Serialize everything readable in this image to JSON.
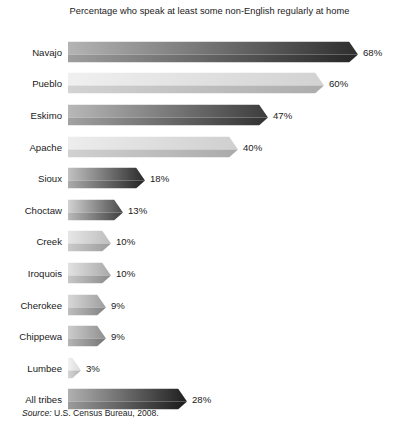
{
  "chart_data": {
    "type": "bar",
    "orientation": "horizontal",
    "title": "Percentage who speak at least some non-English regularly at home",
    "xlabel": "",
    "ylabel": "",
    "xlim": [
      0,
      68
    ],
    "grid": false,
    "legend": null,
    "value_suffix": "%",
    "categories": [
      "Navajo",
      "Pueblo",
      "Eskimo",
      "Apache",
      "Sioux",
      "Choctaw",
      "Creek",
      "Iroquois",
      "Cherokee",
      "Chippewa",
      "Lumbee",
      "All tribes"
    ],
    "values": [
      68,
      60,
      47,
      40,
      18,
      13,
      10,
      10,
      9,
      9,
      3,
      28
    ],
    "data_labels": [
      "68%",
      "60%",
      "47%",
      "40%",
      "18%",
      "13%",
      "10%",
      "10%",
      "9%",
      "9%",
      "3%",
      "28%"
    ],
    "bar_shades": [
      {
        "light": "#b4b4b4",
        "dark": "#2e2e2e"
      },
      {
        "light": "#f0f0f0",
        "dark": "#d2d2d2"
      },
      {
        "light": "#b8b8b8",
        "dark": "#3c3c3c"
      },
      {
        "light": "#ededed",
        "dark": "#cfcfcf"
      },
      {
        "light": "#c2c2c2",
        "dark": "#2a2a2a"
      },
      {
        "light": "#d2d2d2",
        "dark": "#4a4a4a"
      },
      {
        "light": "#e6e6e6",
        "dark": "#bdbdbd"
      },
      {
        "light": "#e2e2e2",
        "dark": "#a8a8a8"
      },
      {
        "light": "#d8d8d8",
        "dark": "#9d9d9d"
      },
      {
        "light": "#cccccc",
        "dark": "#8f8f8f"
      },
      {
        "light": "#f2f2f2",
        "dark": "#d8d8d8"
      },
      {
        "light": "#b0b0b0",
        "dark": "#1f1f1f"
      }
    ],
    "annotations": []
  },
  "source": {
    "label": "Source:",
    "text": " U.S. Census Bureau, 2008."
  },
  "colors": {
    "background": "#ffffff",
    "text": "#1a1a1a"
  }
}
